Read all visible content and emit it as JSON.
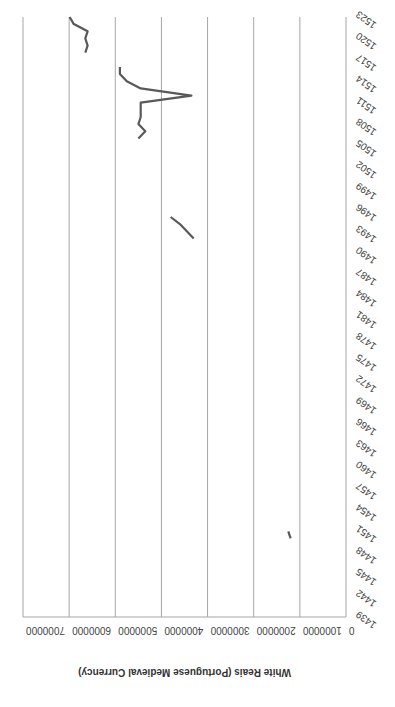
{
  "chart_data": {
    "type": "line",
    "orientation_note": "rendered rotated 180 degrees",
    "title": "",
    "xlabel": "",
    "ylabel": "White Reais (Portuguese Medieval Currency)",
    "ylim": [
      0,
      7000000
    ],
    "y_ticks": [
      "0",
      "1000000",
      "2000000",
      "3000000",
      "4000000",
      "5000000",
      "6000000",
      "7000000"
    ],
    "x_range": [
      1439,
      1523
    ],
    "x_ticks": [
      "1439",
      "1442",
      "1445",
      "1448",
      "1451",
      "1454",
      "1457",
      "1460",
      "1463",
      "1466",
      "1469",
      "1472",
      "1475",
      "1478",
      "1481",
      "1484",
      "1487",
      "1490",
      "1493",
      "1496",
      "1499",
      "1502",
      "1505",
      "1508",
      "1511",
      "1514",
      "1517",
      "1520",
      "1523"
    ],
    "grid": true,
    "legend": null,
    "series": [
      {
        "name": "White Reais",
        "color": "#595959",
        "segments": [
          {
            "x": [
              1450,
              1451
            ],
            "y": [
              1200000,
              1250000
            ]
          },
          {
            "x": [
              1492,
              1493,
              1494,
              1495
            ],
            "y": [
              3300000,
              3450000,
              3600000,
              3800000
            ]
          },
          {
            "x": [
              1506,
              1507,
              1508,
              1509,
              1510,
              1511,
              1512,
              1513,
              1514,
              1515,
              1516
            ],
            "y": [
              4500000,
              4350000,
              4500000,
              4450000,
              4450000,
              4450000,
              3350000,
              4450000,
              4750000,
              4900000,
              4900000
            ]
          },
          {
            "x": [
              1518,
              1519,
              1520,
              1521,
              1522,
              1523
            ],
            "y": [
              5650000,
              5600000,
              5650000,
              5600000,
              5900000,
              5990000
            ]
          }
        ]
      }
    ]
  }
}
